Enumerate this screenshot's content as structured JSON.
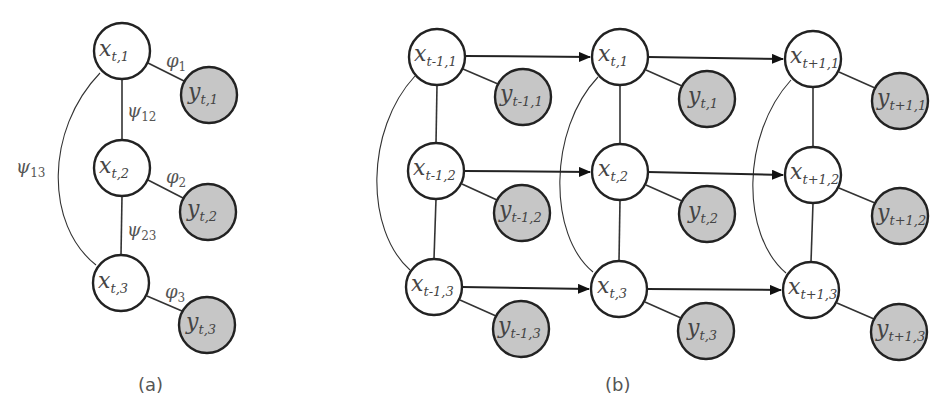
{
  "panel_a": {
    "caption": "(a)",
    "nodes": [
      {
        "id": "x_t1",
        "var": "x",
        "sub": "t,1",
        "type": "hidden",
        "cx": 122,
        "cy": 51
      },
      {
        "id": "x_t2",
        "var": "x",
        "sub": "t,2",
        "type": "hidden",
        "cx": 122,
        "cy": 168
      },
      {
        "id": "x_t3",
        "var": "x",
        "sub": "t,3",
        "type": "hidden",
        "cx": 121,
        "cy": 283
      },
      {
        "id": "y_t1",
        "var": "y",
        "sub": "t,1",
        "type": "observed",
        "cx": 209,
        "cy": 95
      },
      {
        "id": "y_t2",
        "var": "y",
        "sub": "t,2",
        "type": "observed",
        "cx": 208,
        "cy": 212
      },
      {
        "id": "y_t3",
        "var": "y",
        "sub": "t,3",
        "type": "observed",
        "cx": 207,
        "cy": 325
      }
    ],
    "factor_labels": [
      {
        "sym": "φ",
        "sub": "1",
        "x": 166,
        "y": 65
      },
      {
        "sym": "φ",
        "sub": "2",
        "x": 166,
        "y": 182
      },
      {
        "sym": "φ",
        "sub": "3",
        "x": 165,
        "y": 297
      },
      {
        "sym": "ψ",
        "sub": "12",
        "x": 127,
        "y": 118
      },
      {
        "sym": "ψ",
        "sub": "23",
        "x": 127,
        "y": 236
      },
      {
        "sym": "ψ",
        "sub": "13",
        "x": 16,
        "y": 172
      }
    ]
  },
  "panel_b": {
    "caption": "(b)",
    "columns": [
      {
        "time": "t-1",
        "x_cx": 437,
        "y_cx": 523
      },
      {
        "time": "t",
        "x_cx": 620,
        "y_cx": 707
      },
      {
        "time": "t+1",
        "x_cx": 813,
        "y_cx": 900
      }
    ],
    "nodes": [
      {
        "id": "x_tm1_1",
        "var": "x",
        "sub": "t-1,1",
        "type": "hidden",
        "cx": 437,
        "cy": 57
      },
      {
        "id": "x_tm1_2",
        "var": "x",
        "sub": "t-1,2",
        "type": "hidden",
        "cx": 436,
        "cy": 171
      },
      {
        "id": "x_tm1_3",
        "var": "x",
        "sub": "t-1,3",
        "type": "hidden",
        "cx": 434,
        "cy": 287
      },
      {
        "id": "y_tm1_1",
        "var": "y",
        "sub": "t-1,1",
        "type": "observed",
        "cx": 523,
        "cy": 97
      },
      {
        "id": "y_tm1_2",
        "var": "y",
        "sub": "t-1,2",
        "type": "observed",
        "cx": 522,
        "cy": 213
      },
      {
        "id": "y_tm1_3",
        "var": "y",
        "sub": "t-1,3",
        "type": "observed",
        "cx": 521,
        "cy": 329
      },
      {
        "id": "x_t_1",
        "var": "x",
        "sub": "t,1",
        "type": "hidden",
        "cx": 620,
        "cy": 57
      },
      {
        "id": "x_t_2",
        "var": "x",
        "sub": "t,2",
        "type": "hidden",
        "cx": 620,
        "cy": 172
      },
      {
        "id": "x_t_3",
        "var": "x",
        "sub": "t,3",
        "type": "hidden",
        "cx": 619,
        "cy": 289
      },
      {
        "id": "y_t_1",
        "var": "y",
        "sub": "t,1",
        "type": "observed",
        "cx": 707,
        "cy": 99
      },
      {
        "id": "y_t_2",
        "var": "y",
        "sub": "t,2",
        "type": "observed",
        "cx": 707,
        "cy": 214
      },
      {
        "id": "y_t_3",
        "var": "y",
        "sub": "t,3",
        "type": "observed",
        "cx": 706,
        "cy": 331
      },
      {
        "id": "x_tp1_1",
        "var": "x",
        "sub": "t+1,1",
        "type": "hidden",
        "cx": 813,
        "cy": 59
      },
      {
        "id": "x_tp1_2",
        "var": "x",
        "sub": "t+1,2",
        "type": "hidden",
        "cx": 813,
        "cy": 175
      },
      {
        "id": "x_tp1_3",
        "var": "x",
        "sub": "t+1,3",
        "type": "hidden",
        "cx": 811,
        "cy": 290
      },
      {
        "id": "y_tp1_1",
        "var": "y",
        "sub": "t+1,1",
        "type": "observed",
        "cx": 900,
        "cy": 101
      },
      {
        "id": "y_tp1_2",
        "var": "y",
        "sub": "t+1,2",
        "type": "observed",
        "cx": 900,
        "cy": 216
      },
      {
        "id": "y_tp1_3",
        "var": "y",
        "sub": "t+1,3",
        "type": "observed",
        "cx": 899,
        "cy": 332
      }
    ],
    "directed_edges": [
      {
        "from": "x_tm1_1",
        "to": "x_t_1"
      },
      {
        "from": "x_tm1_2",
        "to": "x_t_2"
      },
      {
        "from": "x_tm1_3",
        "to": "x_t_3"
      },
      {
        "from": "x_t_1",
        "to": "x_tp1_1"
      },
      {
        "from": "x_t_2",
        "to": "x_tp1_2"
      },
      {
        "from": "x_t_3",
        "to": "x_tp1_3"
      }
    ]
  },
  "colors": {
    "hidden_fill": "#ffffff",
    "observed_fill": "#c6c6c6",
    "stroke": "#222222",
    "text": "#444444"
  }
}
